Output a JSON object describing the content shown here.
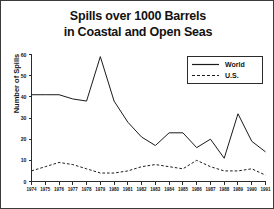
{
  "chart_data": {
    "type": "line",
    "title": "Spills over 1000 Barrels in Coastal and Open Seas",
    "title_lines": [
      "Spills over 1000 Barrels",
      "in Coastal and Open Seas"
    ],
    "xlabel": "",
    "ylabel": "Number of Spills",
    "ylim": [
      0,
      60
    ],
    "yticks": [
      0,
      10,
      20,
      30,
      40,
      50,
      60
    ],
    "ytick_labels": [
      "0",
      "10",
      "20",
      "30",
      "40",
      "50",
      "60"
    ],
    "grid": false,
    "legend_position": "upper right",
    "categories": [
      1974,
      1975,
      1976,
      1977,
      1978,
      1979,
      1980,
      1981,
      1982,
      1983,
      1984,
      1985,
      1986,
      1987,
      1988,
      1989,
      1990,
      1991
    ],
    "xtick_labels": [
      "1974",
      "1975",
      "1976",
      "1977",
      "1978",
      "1979",
      "1980",
      "1981",
      "1982",
      "1983",
      "1984",
      "1985",
      "1986",
      "1987",
      "1988",
      "1989",
      "1990",
      "1991"
    ],
    "series": [
      {
        "name": "World",
        "style": "solid",
        "color": "#1a1a1a",
        "values": [
          41,
          41,
          41,
          39,
          38,
          59,
          38,
          28,
          21,
          17,
          23,
          23,
          16,
          20,
          11,
          32,
          19,
          14
        ]
      },
      {
        "name": "U.S.",
        "style": "dashed",
        "color": "#1a1a1a",
        "values": [
          5,
          7,
          9,
          8,
          6,
          4,
          4,
          5,
          7,
          8,
          7,
          6,
          10,
          7,
          5,
          5,
          6,
          3
        ]
      }
    ]
  },
  "legend": {
    "items": [
      {
        "label": "World",
        "style": "solid"
      },
      {
        "label": "U.S.",
        "style": "dashed"
      }
    ]
  }
}
